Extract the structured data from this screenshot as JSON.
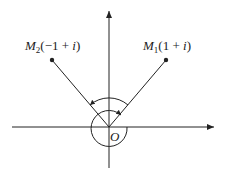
{
  "diagram": {
    "title": "",
    "origin_label": "O",
    "points": [
      {
        "id": "M1",
        "name": "M",
        "subscript": "1",
        "coords": "(1 + ",
        "imag": "i",
        "close": ")",
        "complex": "1 + i"
      },
      {
        "id": "M2",
        "name": "M",
        "subscript": "2",
        "coords": "(−1 + ",
        "imag": "i",
        "close": ")",
        "complex": "−1 + i"
      }
    ],
    "colors": {
      "stroke": "#222222",
      "background": "#ffffff"
    }
  }
}
